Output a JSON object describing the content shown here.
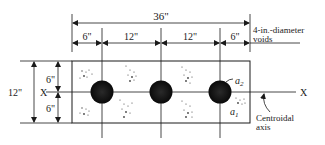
{
  "diagram": {
    "title_dimension": "36\"",
    "top_dimensions": [
      "6\"",
      "12\"",
      "12\"",
      "6\""
    ],
    "void_label_line1": "4-in.-diameter",
    "void_label_line2": "voids",
    "height_total": "12\"",
    "height_upper": "6\"",
    "height_lower": "6\"",
    "axis_label_left": "X",
    "axis_label_right": "X",
    "area_label_a2": "a",
    "area_label_a2_sub": "2",
    "area_label_a1": "a",
    "area_label_a1_sub": "1",
    "centroid_label_line1": "Centroidal",
    "centroid_label_line2": "axis",
    "colors": {
      "ink": "#1a1a1a",
      "void_fill": "#111111",
      "background": "#ffffff"
    },
    "void_count": 3
  }
}
